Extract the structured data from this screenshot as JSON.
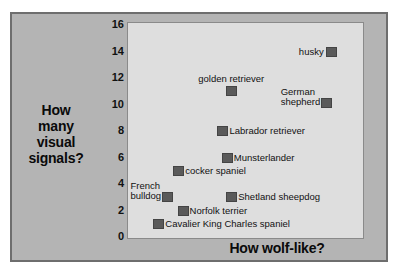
{
  "chart_data": {
    "type": "scatter",
    "title": "",
    "xlabel": "How wolf-like?",
    "ylabel": "How many visual signals?",
    "ylabel_lines": [
      "How",
      "many",
      "visual",
      "signals?"
    ],
    "yticks": [
      0,
      2,
      4,
      6,
      8,
      10,
      12,
      14,
      16
    ],
    "ytick_labels": [
      "0",
      "2",
      "4",
      "6",
      "8",
      "10",
      "12",
      "14",
      "16"
    ],
    "ylim": [
      0,
      16
    ],
    "xlim": [
      0,
      10
    ],
    "xticks": [],
    "xtick_labels": [],
    "grid": false,
    "legend": "none",
    "marker_color": "#5a5a5a",
    "plot_background": "#dedede",
    "panel_background": "#b4b4b4",
    "points": [
      {
        "label": "husky",
        "x": 8.9,
        "y": 14.0,
        "label_pos": "left"
      },
      {
        "label": "golden retriever",
        "x": 4.4,
        "y": 11.0,
        "label_pos": "above"
      },
      {
        "label": "German shepherd",
        "x": 8.7,
        "y": 10.1,
        "label_pos": "left2",
        "label_lines": [
          "German",
          "shepherd"
        ]
      },
      {
        "label": "Labrador retriever",
        "x": 4.0,
        "y": 8.0,
        "label_pos": "right"
      },
      {
        "label": "Munsterlander",
        "x": 4.2,
        "y": 6.0,
        "label_pos": "right"
      },
      {
        "label": "cocker spaniel",
        "x": 2.0,
        "y": 5.0,
        "label_pos": "right"
      },
      {
        "label": "French bulldog",
        "x": 1.5,
        "y": 3.0,
        "label_pos": "left2",
        "label_lines": [
          "French",
          "bulldog"
        ]
      },
      {
        "label": "Shetland sheepdog",
        "x": 4.4,
        "y": 3.0,
        "label_pos": "right"
      },
      {
        "label": "Norfolk terrier",
        "x": 2.2,
        "y": 2.0,
        "label_pos": "right"
      },
      {
        "label": "Cavalier King Charles spaniel",
        "x": 1.1,
        "y": 1.0,
        "label_pos": "right"
      }
    ]
  },
  "axis": {
    "x_title": "How wolf-like?",
    "y_title_lines": [
      "How",
      "many",
      "visual",
      "signals?"
    ]
  }
}
